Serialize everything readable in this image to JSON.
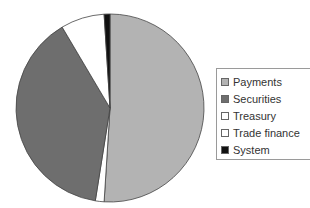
{
  "chart_data": {
    "type": "pie",
    "title": "",
    "categories": [
      "Payments",
      "Securities",
      "Treasury",
      "Trade finance",
      "System"
    ],
    "values": [
      51,
      39,
      1.5,
      7.5,
      1
    ],
    "colors": [
      "#b3b3b3",
      "#6e6e6e",
      "#ffffff",
      "#ffffff",
      "#111111"
    ],
    "draw_order": [
      {
        "name": "Payments",
        "value": 51,
        "color": "#b3b3b3"
      },
      {
        "name": "Treasury",
        "value": 1.5,
        "color": "#ffffff"
      },
      {
        "name": "Securities",
        "value": 39,
        "color": "#6e6e6e"
      },
      {
        "name": "Trade finance",
        "value": 7.5,
        "color": "#ffffff"
      },
      {
        "name": "System",
        "value": 1,
        "color": "#111111"
      }
    ],
    "legend_position": "right",
    "units": "percent (estimated)"
  },
  "legend": {
    "items": [
      {
        "label": "Payments",
        "color": "#b3b3b3"
      },
      {
        "label": "Securities",
        "color": "#6e6e6e"
      },
      {
        "label": "Treasury",
        "color": "#ffffff"
      },
      {
        "label": "Trade finance",
        "color": "#ffffff"
      },
      {
        "label": "System",
        "color": "#111111"
      }
    ]
  }
}
